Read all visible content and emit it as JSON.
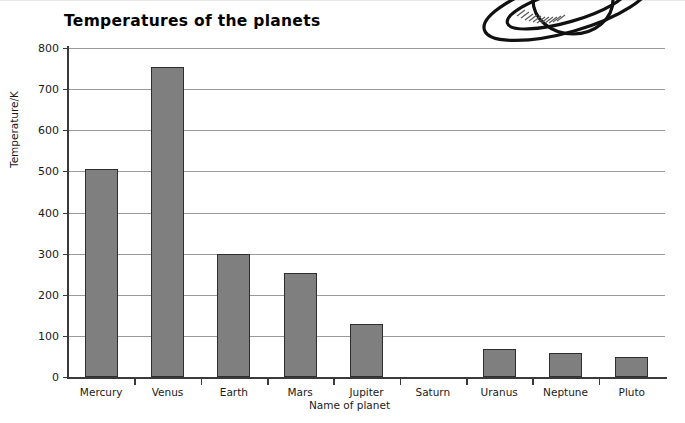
{
  "chart_data": {
    "type": "bar",
    "title": "Temperatures of the planets",
    "xlabel": "Name of planet",
    "ylabel": "Temperature/K",
    "categories": [
      "Mercury",
      "Venus",
      "Earth",
      "Mars",
      "Jupiter",
      "Saturn",
      "Uranus",
      "Neptune",
      "Pluto"
    ],
    "values": [
      505,
      755,
      300,
      253,
      130,
      0,
      68,
      58,
      48
    ],
    "ylim": [
      0,
      800
    ],
    "ytick_step": 100,
    "yticks": [
      800,
      700,
      600,
      500,
      400,
      300,
      200,
      100,
      0
    ],
    "grid": true,
    "legend": false,
    "bar_fill_color": "#7f7f7f",
    "bar_edge_color": "#2e2e2e",
    "axis_color": "#3a3a3a",
    "gridline_color": "#9a9a9a"
  },
  "decoration": {
    "saturn_icon_name": "saturn-planet-illustration"
  }
}
